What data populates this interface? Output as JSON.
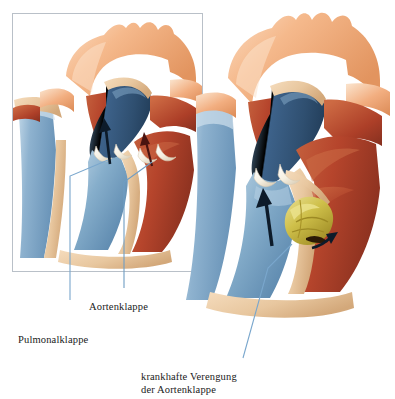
{
  "figure": {
    "language": "de",
    "panels": [
      {
        "id": "inset-normal",
        "name": "normal-heart-inset",
        "description": "Ausschnitt: Herz mit normaler Aorten- und Pulmonalklappe",
        "border_color": "#b9c0c8"
      },
      {
        "id": "main-stenosis",
        "name": "stenotic-heart-main",
        "description": "Herz mit krankhaft verengter Aortenklappe",
        "border_color": "none"
      }
    ]
  },
  "labels": {
    "aortenklappe": "Aortenklappe",
    "pulmonalklappe": "Pulmonalklappe",
    "stenose_line1": "krankhafte Verengung",
    "stenose_line2": "der Aortenklappe"
  },
  "colors": {
    "aorta_peach": "#f3b184",
    "aorta_peach_light": "#f9d0b2",
    "aorta_peach_dark": "#e0915f",
    "myocardium_red": "#b6452c",
    "myocardium_red_dark": "#8d3220",
    "myocardium_red_light": "#c9613f",
    "vein_blue": "#7ba3c4",
    "vein_blue_light": "#a9c6dc",
    "artery_blue_dark": "#36597c",
    "artery_blue_mid": "#4c7399",
    "vessel_wall_tan": "#e9c9a3",
    "vessel_wall_tan_dark": "#d2a878",
    "valve_white": "#fdfbf4",
    "calcification_yellow": "#cfc04a",
    "calcification_yellow_light": "#e3da86",
    "calcification_yellow_dark": "#a89328",
    "leader_line_blue": "#7aa7cd",
    "arrow_black": "#0d1b2a",
    "text_black": "#1a1a1a",
    "background": "#ffffff"
  },
  "annotations": {
    "arrows": [
      {
        "name": "inset-pulmonary-flow-arrow",
        "panel": "inset-normal",
        "direction": "up"
      },
      {
        "name": "inset-aortic-flow-arrow",
        "panel": "inset-normal",
        "direction": "up"
      },
      {
        "name": "main-pulmonary-flow-arrow",
        "panel": "main-stenosis",
        "direction": "up"
      },
      {
        "name": "main-stenotic-jet-arrow",
        "panel": "main-stenosis",
        "direction": "right"
      }
    ],
    "leader_lines": [
      {
        "name": "leader-line-pulmonalklappe",
        "from": "inset pulmonary valve",
        "to": "Pulmonalklappe"
      },
      {
        "name": "leader-line-aortenklappe",
        "from": "inset aortic valve",
        "to": "Aortenklappe"
      },
      {
        "name": "leader-line-stenose",
        "from": "main stenotic valve",
        "to": "krankhafte Verengung der Aortenklappe"
      }
    ]
  }
}
